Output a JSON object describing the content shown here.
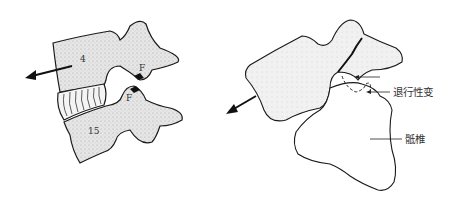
{
  "figure_left": {
    "upper_vertebra_label": "4",
    "lower_vertebra_label": "15",
    "upper_facet_label": "F",
    "lower_facet_label": "F",
    "arrow_direction": "anterior-left"
  },
  "figure_right": {
    "degeneration_label": "退行性变",
    "sacrum_label": "骶椎",
    "arrow_direction": "anterior-down-left"
  },
  "colors": {
    "bone_fill": "#e2e2e2",
    "outline": "#1a1a1a",
    "background": "#ffffff"
  }
}
